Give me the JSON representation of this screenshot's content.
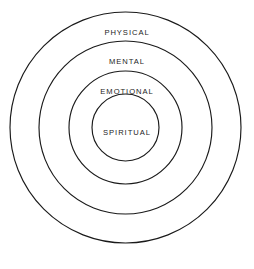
{
  "diagram": {
    "type": "concentric-circles",
    "background_color": "#ffffff",
    "stroke_color": "#1a1a1a",
    "text_color": "#242424",
    "center": {
      "x": 125.5,
      "y": 127.5
    },
    "rings": [
      {
        "label": "PHYSICAL",
        "level": 1,
        "position": "outermost",
        "radius": 115.5,
        "diameter": 231,
        "label_y": 33
      },
      {
        "label": "MENTAL",
        "level": 2,
        "position": "second",
        "radius": 86.5,
        "diameter": 173,
        "label_y": 62
      },
      {
        "label": "EMOTIONAL",
        "level": 3,
        "position": "third",
        "radius": 56.5,
        "diameter": 113,
        "label_y": 92
      },
      {
        "label": "SPIRITUAL",
        "level": 4,
        "position": "innermost",
        "radius": 33.5,
        "diameter": 67,
        "label_y": 133
      }
    ]
  }
}
